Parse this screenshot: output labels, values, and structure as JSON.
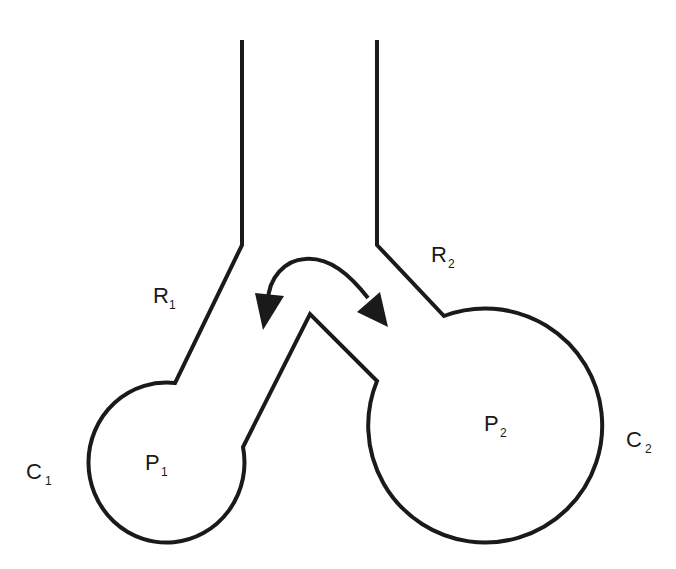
{
  "diagram": {
    "labels": {
      "R1": {
        "main": "R",
        "sub": "1"
      },
      "R2": {
        "main": "R",
        "sub": "2"
      },
      "P1": {
        "main": "P",
        "sub": "1"
      },
      "P2": {
        "main": "P",
        "sub": "2"
      },
      "C1": {
        "main": "C",
        "sub": "1"
      },
      "C2": {
        "main": "C",
        "sub": "2"
      }
    },
    "arrow": "bidirectional-curved-arrow",
    "stroke_color": "#1a1a1a",
    "background": "#ffffff"
  }
}
